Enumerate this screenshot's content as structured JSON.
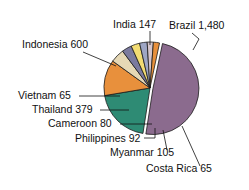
{
  "chart_data": {
    "type": "pie",
    "title": "",
    "subtitle": "",
    "xlabel": "",
    "ylabel": "",
    "legend_position": "none",
    "grid": false,
    "total": 3013,
    "categories": [
      "Brazil",
      "Indonesia",
      "Thailand",
      "India",
      "Myanmar",
      "Philippines",
      "Cameroon",
      "Vietnam",
      "Costa Rica"
    ],
    "values": [
      1480,
      600,
      379,
      147,
      105,
      92,
      80,
      65,
      65
    ],
    "labels": [
      "Brazil 1,480",
      "Indonesia 600",
      "Thailand 379",
      "India 147",
      "Myanmar 105",
      "Philippines 92",
      "Cameroon 80",
      "Vietnam 65",
      "Costa Rica 65"
    ],
    "colors": [
      "#8b6b8e",
      "#2e8b74",
      "#e8903c",
      "#e6d8b5",
      "#7b7a9e",
      "#f2dc73",
      "#9ea6c4",
      "#d6c6cc",
      "#e8903c"
    ],
    "slices": [
      {
        "name": "Brazil",
        "value": 1480,
        "label": "Brazil 1,480",
        "color": "#8b6b8e",
        "exploded": true
      },
      {
        "name": "Indonesia",
        "value": 600,
        "label": "Indonesia 600",
        "color": "#2e8b74",
        "exploded": false
      },
      {
        "name": "Thailand",
        "value": 379,
        "label": "Thailand 379",
        "color": "#e8903c",
        "exploded": false
      },
      {
        "name": "India",
        "value": 147,
        "label": "India 147",
        "color": "#e6d8b5",
        "exploded": false
      },
      {
        "name": "Myanmar",
        "value": 105,
        "label": "Myanmar 105",
        "color": "#7b7a9e",
        "exploded": false
      },
      {
        "name": "Philippines",
        "value": 92,
        "label": "Philippines 92",
        "color": "#f2dc73",
        "exploded": false
      },
      {
        "name": "Cameroon",
        "value": 80,
        "label": "Cameroon 80",
        "color": "#9ea6c4",
        "exploded": false
      },
      {
        "name": "Vietnam",
        "value": 65,
        "label": "Vietnam 65",
        "color": "#d6c6cc",
        "exploded": false
      },
      {
        "name": "Costa Rica",
        "value": 65,
        "label": "Costa Rica 65",
        "color": "#e8903c",
        "exploded": false
      }
    ]
  },
  "annotations": {
    "brazil": {
      "label": "Brazil 1,480",
      "text_x": 169,
      "text_y": 29,
      "anchor": "start",
      "line": [
        [
          192,
          33
        ],
        [
          199,
          39
        ],
        [
          193,
          50
        ]
      ]
    },
    "india": {
      "label": "India 147",
      "text_x": 113,
      "text_y": 28,
      "anchor": "start",
      "line": [
        [
          150,
          31
        ],
        [
          150,
          45
        ]
      ]
    },
    "indonesia": {
      "label": "Indonesia 600",
      "text_x": 22,
      "text_y": 48,
      "anchor": "start",
      "line": [
        [
          83,
          52
        ],
        [
          116,
          66
        ]
      ]
    },
    "vietnam": {
      "label": "Vietnam 65",
      "text_x": 18,
      "text_y": 99,
      "anchor": "start",
      "line": [
        [
          79,
          96
        ],
        [
          120,
          96
        ]
      ]
    },
    "thailand": {
      "label": "Thailand 379",
      "text_x": 32,
      "text_y": 113,
      "anchor": "start",
      "line": [
        [
          100,
          110
        ],
        [
          129,
          110
        ]
      ]
    },
    "cameroon": {
      "label": "Cameroon 80",
      "text_x": 48,
      "text_y": 127,
      "anchor": "start",
      "line": [
        [
          120,
          124
        ],
        [
          152,
          124
        ]
      ]
    },
    "philippines": {
      "label": "Philippines 92",
      "text_x": 75,
      "text_y": 142,
      "anchor": "start",
      "line": [
        [
          144,
          138
        ],
        [
          155,
          138
        ],
        [
          155,
          128
        ]
      ]
    },
    "myanmar": {
      "label": "Myanmar 105",
      "text_x": 110,
      "text_y": 156,
      "anchor": "start",
      "line": [
        [
          167,
          150
        ],
        [
          163,
          130
        ]
      ]
    },
    "costarica": {
      "label": "Costa Rica 65",
      "text_x": 146,
      "text_y": 172,
      "anchor": "start",
      "line": [
        [
          200,
          166
        ],
        [
          182,
          126
        ]
      ]
    }
  },
  "geometry": {
    "cx": 150,
    "cy": 88,
    "radius": 46,
    "start_angle_deg": -78,
    "explode_offset": 3
  }
}
